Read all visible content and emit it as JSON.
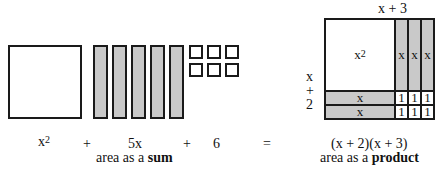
{
  "sum_figure": {
    "square_label": "x",
    "square_exp": "2",
    "bar_count": 5,
    "unit_count": 6
  },
  "product_figure": {
    "top_label": "x + 3",
    "side_label": [
      "x",
      "+",
      "2"
    ],
    "big_label": "x",
    "big_exp": "2",
    "column_labels": [
      "x",
      "x",
      "x"
    ],
    "row_labels": [
      "x",
      "x"
    ],
    "unit_labels": [
      "1",
      "1",
      "1",
      "1",
      "1",
      "1"
    ]
  },
  "equation": {
    "term1": "x",
    "term1_exp": "2",
    "plus1": "+",
    "term2": "5x",
    "plus2": "+",
    "term3": "6",
    "equals": "=",
    "product": "(x + 2)(x + 3)"
  },
  "captions": {
    "sum_prefix": "area as a ",
    "sum_bold": "sum",
    "product_prefix": "area as a ",
    "product_bold": "product"
  },
  "colors": {
    "shade": "#c9c9c9",
    "line": "#1a1a1a"
  }
}
